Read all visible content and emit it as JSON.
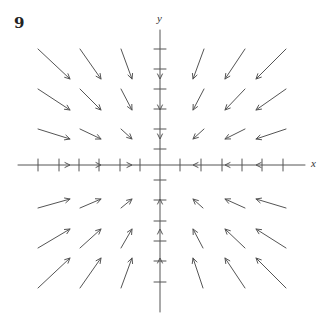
{
  "figure": {
    "number": "9",
    "x_axis_label": "x",
    "y_axis_label": "y",
    "colors": {
      "axis": "#555555",
      "arrow": "#555555",
      "background": "#ffffff"
    },
    "origin_px": [
      160,
      165
    ],
    "x_axis_px": {
      "from": 18,
      "to": 305
    },
    "y_axis_px": {
      "from": 30,
      "to": 312
    },
    "x_ticks_px": [
      38,
      59,
      79,
      99,
      120,
      140,
      180,
      201,
      222,
      242,
      262,
      283
    ],
    "y_ticks_px": [
      49,
      69,
      89,
      109,
      129,
      149,
      180,
      200,
      221,
      241,
      261,
      282
    ],
    "vector_field": {
      "description": "Vector field with all arrows pointing toward the origin (radial, inward)",
      "arrows": [
        {
          "tail": [
            38,
            49
          ],
          "head": [
            70,
            79
          ]
        },
        {
          "tail": [
            80,
            49
          ],
          "head": [
            101,
            79
          ]
        },
        {
          "tail": [
            121,
            49
          ],
          "head": [
            132,
            79
          ]
        },
        {
          "tail": [
            38,
            89
          ],
          "head": [
            70,
            110
          ]
        },
        {
          "tail": [
            80,
            89
          ],
          "head": [
            101,
            110
          ]
        },
        {
          "tail": [
            121,
            89
          ],
          "head": [
            132,
            110
          ]
        },
        {
          "tail": [
            38,
            129
          ],
          "head": [
            70,
            139
          ]
        },
        {
          "tail": [
            80,
            129
          ],
          "head": [
            101,
            139
          ]
        },
        {
          "tail": [
            121,
            129
          ],
          "head": [
            132,
            139
          ]
        },
        {
          "tail": [
            204,
            49
          ],
          "head": [
            193,
            79
          ]
        },
        {
          "tail": [
            245,
            49
          ],
          "head": [
            225,
            79
          ]
        },
        {
          "tail": [
            286,
            49
          ],
          "head": [
            256,
            79
          ]
        },
        {
          "tail": [
            204,
            89
          ],
          "head": [
            193,
            110
          ]
        },
        {
          "tail": [
            245,
            89
          ],
          "head": [
            225,
            110
          ]
        },
        {
          "tail": [
            286,
            89
          ],
          "head": [
            256,
            110
          ]
        },
        {
          "tail": [
            204,
            129
          ],
          "head": [
            193,
            139
          ]
        },
        {
          "tail": [
            245,
            129
          ],
          "head": [
            225,
            139
          ]
        },
        {
          "tail": [
            286,
            129
          ],
          "head": [
            256,
            139
          ]
        },
        {
          "tail": [
            38,
            208
          ],
          "head": [
            70,
            199
          ]
        },
        {
          "tail": [
            80,
            208
          ],
          "head": [
            101,
            199
          ]
        },
        {
          "tail": [
            121,
            208
          ],
          "head": [
            132,
            199
          ]
        },
        {
          "tail": [
            38,
            248
          ],
          "head": [
            70,
            229
          ]
        },
        {
          "tail": [
            80,
            248
          ],
          "head": [
            101,
            229
          ]
        },
        {
          "tail": [
            121,
            248
          ],
          "head": [
            132,
            229
          ]
        },
        {
          "tail": [
            38,
            288
          ],
          "head": [
            70,
            258
          ]
        },
        {
          "tail": [
            80,
            288
          ],
          "head": [
            101,
            258
          ]
        },
        {
          "tail": [
            121,
            288
          ],
          "head": [
            132,
            258
          ]
        },
        {
          "tail": [
            203,
            208
          ],
          "head": [
            193,
            199
          ]
        },
        {
          "tail": [
            245,
            208
          ],
          "head": [
            225,
            199
          ]
        },
        {
          "tail": [
            286,
            208
          ],
          "head": [
            256,
            199
          ]
        },
        {
          "tail": [
            203,
            248
          ],
          "head": [
            193,
            229
          ]
        },
        {
          "tail": [
            245,
            248
          ],
          "head": [
            225,
            229
          ]
        },
        {
          "tail": [
            286,
            248
          ],
          "head": [
            256,
            229
          ]
        },
        {
          "tail": [
            203,
            288
          ],
          "head": [
            193,
            258
          ]
        },
        {
          "tail": [
            245,
            288
          ],
          "head": [
            225,
            258
          ]
        },
        {
          "tail": [
            286,
            288
          ],
          "head": [
            256,
            258
          ]
        }
      ],
      "axis_arrowheads": [
        {
          "at": [
            70,
            165
          ],
          "dir": "right"
        },
        {
          "at": [
            101,
            165
          ],
          "dir": "right"
        },
        {
          "at": [
            132,
            165
          ],
          "dir": "right"
        },
        {
          "at": [
            193,
            165
          ],
          "dir": "left"
        },
        {
          "at": [
            225,
            165
          ],
          "dir": "left"
        },
        {
          "at": [
            256,
            165
          ],
          "dir": "left"
        },
        {
          "at": [
            160,
            79
          ],
          "dir": "down"
        },
        {
          "at": [
            160,
            110
          ],
          "dir": "down"
        },
        {
          "at": [
            160,
            139
          ],
          "dir": "down"
        },
        {
          "at": [
            160,
            199
          ],
          "dir": "up"
        },
        {
          "at": [
            160,
            229
          ],
          "dir": "up"
        },
        {
          "at": [
            160,
            258
          ],
          "dir": "up"
        }
      ]
    }
  }
}
